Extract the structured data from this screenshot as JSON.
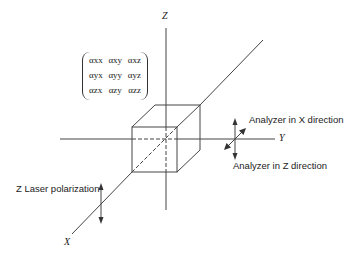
{
  "figure": {
    "axes": {
      "z": "Z",
      "y": "Y",
      "x": "X"
    },
    "tensor": [
      [
        "αxx",
        "αxy",
        "αxz"
      ],
      [
        "αyx",
        "αyy",
        "αyz"
      ],
      [
        "αzx",
        "αzy",
        "αzz"
      ]
    ],
    "labels": {
      "analyzer_x": "Analyzer in X direction",
      "analyzer_z": "Analyzer in Z direction",
      "laser": "Z Laser polarization"
    }
  }
}
